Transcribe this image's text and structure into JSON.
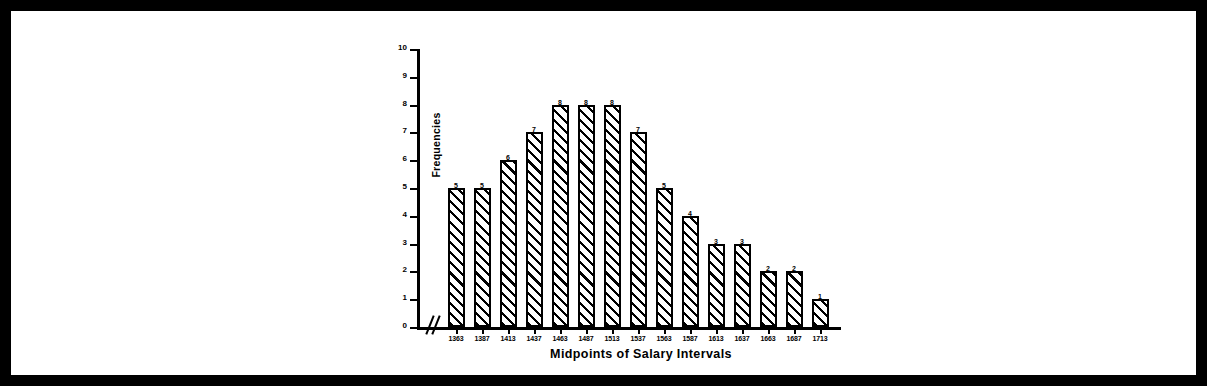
{
  "chart_data": {
    "type": "bar",
    "title": "",
    "xlabel": "Midpoints of Salary Intervals",
    "ylabel": "Frequencies",
    "categories": [
      "1363",
      "1387",
      "1413",
      "1437",
      "1463",
      "1487",
      "1513",
      "1537",
      "1563",
      "1587",
      "1613",
      "1637",
      "1663",
      "1687",
      "1713"
    ],
    "values": [
      5,
      5,
      6,
      7,
      8,
      8,
      8,
      7,
      5,
      4,
      3,
      3,
      2,
      2,
      1
    ],
    "ylim": [
      0,
      10
    ],
    "yticks": [
      "0",
      "1",
      "2",
      "3",
      "4",
      "5",
      "6",
      "7",
      "8",
      "9",
      "10"
    ],
    "grid": false,
    "legend": false,
    "bar_fill": "diagonal-hatch",
    "axis_break_x": true,
    "colors": {
      "ink": "#000000",
      "paper": "#ffffff"
    }
  }
}
